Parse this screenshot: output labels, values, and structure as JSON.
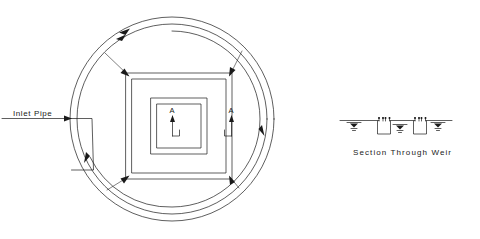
{
  "drawing": {
    "title_plan": "Inlet Pipe",
    "title_section": "Section Through Weir",
    "background_color": "#ffffff",
    "line_color": "#1a1a1a",
    "plan_view": {
      "label_inlet_pipe": "Inlet Pipe",
      "section_marker_left": "A",
      "section_marker_right": "A",
      "tank": {
        "center_x": 172,
        "center_y": 119,
        "circles": [
          {
            "name": "outer-tank-wall",
            "radius": 102
          },
          {
            "name": "inner-tank-wall",
            "radius": 95
          },
          {
            "name": "flow-channel-arc",
            "radius": 88
          }
        ],
        "flow_direction": "counterclockwise",
        "flow_arrow_count": 4
      },
      "weir_box": {
        "square_count": 4,
        "half_sizes": [
          53,
          47,
          28,
          22
        ],
        "corner_leader_count": 4
      }
    },
    "section_view": {
      "caption": "Section Through Weir",
      "water_level_symbol_count": 4,
      "weir_notch_count": 2,
      "baseline_y": 120,
      "baseline_x_start": 340,
      "baseline_x_end": 452
    }
  }
}
